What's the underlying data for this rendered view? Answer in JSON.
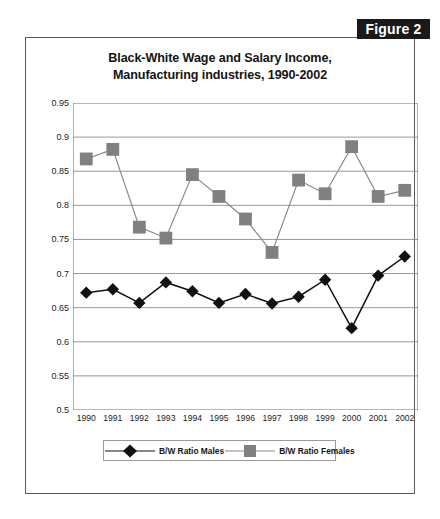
{
  "figure_badge": "Figure 2",
  "chart_data": {
    "type": "line",
    "title_line1": "Black-White Wage and Salary Income,",
    "title_line2": "Manufacturing industries, 1990-2002",
    "title": "Black-White Wage and Salary Income, Manufacturing industries, 1990-2002",
    "xlabel": "",
    "ylabel": "Black - White Ratio",
    "ylim": [
      0.5,
      0.95
    ],
    "ytick_labels": [
      "0.95",
      "0.9",
      "0.85",
      "0.8",
      "0.75",
      "0.7",
      "0.65",
      "0.6",
      "0.55",
      "0.5"
    ],
    "yticks": [
      0.95,
      0.9,
      0.85,
      0.8,
      0.75,
      0.7,
      0.65,
      0.6,
      0.55,
      0.5
    ],
    "grid": true,
    "legend_position": "bottom",
    "categories": [
      "1990",
      "1991",
      "1992",
      "1993",
      "1994",
      "1995",
      "1996",
      "1997",
      "1998",
      "1999",
      "2000",
      "2001",
      "2002"
    ],
    "x": [
      1990,
      1991,
      1992,
      1993,
      1994,
      1995,
      1996,
      1997,
      1998,
      1999,
      2000,
      2001,
      2002
    ],
    "series": [
      {
        "name": "B/W Ratio Males",
        "marker": "diamond",
        "color": "#111111",
        "line_color": "#111111",
        "values": [
          0.672,
          0.677,
          0.657,
          0.687,
          0.674,
          0.657,
          0.67,
          0.656,
          0.666,
          0.691,
          0.62,
          0.697,
          0.725
        ]
      },
      {
        "name": "B/W Ratio Females",
        "marker": "square",
        "color": "#808080",
        "line_color": "#8a8a8a",
        "values": [
          0.868,
          0.882,
          0.768,
          0.752,
          0.845,
          0.813,
          0.78,
          0.731,
          0.837,
          0.817,
          0.886,
          0.813,
          0.822
        ]
      }
    ]
  }
}
